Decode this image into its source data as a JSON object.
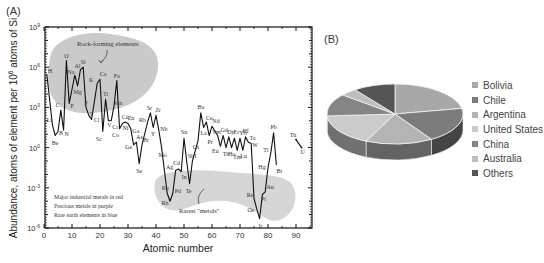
{
  "chart_data": [
    {
      "panel": "(A)",
      "type": "line",
      "title": "",
      "xlabel": "Atomic number",
      "ylabel": "Abundance, atoms of element per 10^6 atoms of Si",
      "xlim": [
        0,
        95
      ],
      "ylim_log10": [
        -6,
        9
      ],
      "xticks": [
        0,
        10,
        20,
        30,
        40,
        50,
        60,
        70,
        80,
        90
      ],
      "yticks": [
        "10^9",
        "10^6",
        "10^3",
        "10^0",
        "10^-3",
        "10^-6"
      ],
      "grid": false,
      "scale": "log",
      "points": [
        {
          "z": 1,
          "el": "H",
          "log": 5.5
        },
        {
          "z": 3,
          "el": "Li",
          "log": 1.7
        },
        {
          "z": 4,
          "el": "Be",
          "log": 0.9
        },
        {
          "z": 5,
          "el": "B",
          "log": 1.2
        },
        {
          "z": 6,
          "el": "C",
          "log": 2.8
        },
        {
          "z": 7,
          "el": "N",
          "log": 1.3
        },
        {
          "z": 8,
          "el": "O",
          "log": 6.5
        },
        {
          "z": 9,
          "el": "F",
          "log": 3.3
        },
        {
          "z": 11,
          "el": "Na",
          "log": 5.4
        },
        {
          "z": 12,
          "el": "Mg",
          "log": 4.6
        },
        {
          "z": 13,
          "el": "Al",
          "log": 5.8
        },
        {
          "z": 14,
          "el": "Si",
          "log": 6.0
        },
        {
          "z": 15,
          "el": "P",
          "log": 3.0
        },
        {
          "z": 16,
          "el": "S",
          "log": 2.4
        },
        {
          "z": 17,
          "el": "Cl",
          "log": 2.1
        },
        {
          "z": 19,
          "el": "K",
          "log": 4.8
        },
        {
          "z": 20,
          "el": "Ca",
          "log": 5.1
        },
        {
          "z": 21,
          "el": "Sc",
          "log": 1.2
        },
        {
          "z": 22,
          "el": "Ti",
          "log": 3.6
        },
        {
          "z": 23,
          "el": "V",
          "log": 2.0
        },
        {
          "z": 24,
          "el": "Cr",
          "log": 2.0
        },
        {
          "z": 25,
          "el": "Mn",
          "log": 3.1
        },
        {
          "z": 26,
          "el": "Fe",
          "log": 5.0
        },
        {
          "z": 27,
          "el": "Co",
          "log": 1.4
        },
        {
          "z": 28,
          "el": "Ni",
          "log": 1.8
        },
        {
          "z": 29,
          "el": "Cu",
          "log": 1.9
        },
        {
          "z": 30,
          "el": "Zn",
          "log": 1.8
        },
        {
          "z": 31,
          "el": "Ga",
          "log": 1.4
        },
        {
          "z": 32,
          "el": "Ge",
          "log": 0.2
        },
        {
          "z": 33,
          "el": "As",
          "log": 0.4
        },
        {
          "z": 34,
          "el": "Se",
          "log": -1.2
        },
        {
          "z": 35,
          "el": "Br",
          "log": 0.2
        },
        {
          "z": 37,
          "el": "Rb",
          "log": 1.9
        },
        {
          "z": 38,
          "el": "Sr",
          "log": 2.6
        },
        {
          "z": 39,
          "el": "Y",
          "log": 1.5
        },
        {
          "z": 40,
          "el": "Zr",
          "log": 2.4
        },
        {
          "z": 41,
          "el": "Nb",
          "log": 1.3
        },
        {
          "z": 42,
          "el": "Mo",
          "log": 0.0
        },
        {
          "z": 44,
          "el": "Ru",
          "log": -3.4
        },
        {
          "z": 45,
          "el": "Rh",
          "log": -4.0
        },
        {
          "z": 46,
          "el": "Pd",
          "log": -3.4
        },
        {
          "z": 47,
          "el": "Ag",
          "log": -1.7
        },
        {
          "z": 48,
          "el": "Cd",
          "log": -1.6
        },
        {
          "z": 49,
          "el": "In",
          "log": -1.8
        },
        {
          "z": 50,
          "el": "Sn",
          "log": 0.7
        },
        {
          "z": 51,
          "el": "Sb",
          "log": -1.1
        },
        {
          "z": 52,
          "el": "Te",
          "log": -2.7
        },
        {
          "z": 53,
          "el": "I",
          "log": -1.0
        },
        {
          "z": 55,
          "el": "Cs",
          "log": 0.5
        },
        {
          "z": 56,
          "el": "Ba",
          "log": 2.6
        },
        {
          "z": 57,
          "el": "La",
          "log": 1.5
        },
        {
          "z": 58,
          "el": "Ce",
          "log": 1.9
        },
        {
          "z": 59,
          "el": "Pr",
          "log": 0.9
        },
        {
          "z": 60,
          "el": "Nd",
          "log": 1.6
        },
        {
          "z": 62,
          "el": "Sm",
          "log": 0.9
        },
        {
          "z": 63,
          "el": "Eu",
          "log": 0.1
        },
        {
          "z": 64,
          "el": "Gd",
          "log": 0.9
        },
        {
          "z": 65,
          "el": "Tb",
          "log": 0.0
        },
        {
          "z": 66,
          "el": "Dy",
          "log": 0.8
        },
        {
          "z": 67,
          "el": "Ho",
          "log": 0.0
        },
        {
          "z": 68,
          "el": "Er",
          "log": 0.7
        },
        {
          "z": 69,
          "el": "Tm",
          "log": -0.2
        },
        {
          "z": 70,
          "el": "Yb",
          "log": 0.7
        },
        {
          "z": 71,
          "el": "Lu",
          "log": -0.2
        },
        {
          "z": 72,
          "el": "Hf",
          "log": 0.8
        },
        {
          "z": 73,
          "el": "Ta",
          "log": 0.4
        },
        {
          "z": 74,
          "el": "W",
          "log": 0.3
        },
        {
          "z": 75,
          "el": "Re",
          "log": -3.8
        },
        {
          "z": 76,
          "el": "Os",
          "log": -4.6
        },
        {
          "z": 77,
          "el": "Ir",
          "log": -5.3
        },
        {
          "z": 78,
          "el": "Pt",
          "log": -3.5
        },
        {
          "z": 79,
          "el": "Au",
          "log": -3.3
        },
        {
          "z": 80,
          "el": "Hg",
          "log": -1.5
        },
        {
          "z": 81,
          "el": "Tl",
          "log": -0.4
        },
        {
          "z": 82,
          "el": "Pb",
          "log": 1.1
        },
        {
          "z": 83,
          "el": "Bi",
          "log": -1.3
        },
        {
          "z": 90,
          "el": "Th",
          "log": 0.6
        },
        {
          "z": 92,
          "el": "U",
          "log": 0.0
        }
      ],
      "annotations": [
        {
          "text": "Rock-forming elements",
          "region": "upper-left shaded blob"
        },
        {
          "text": "Rarest \"metals\"",
          "region": "lower shaded band"
        },
        {
          "text": "Major industrial metals in red"
        },
        {
          "text": "Precious metals in purple"
        },
        {
          "text": "Rare earth elements in blue"
        }
      ]
    },
    {
      "panel": "(B)",
      "type": "pie",
      "title": "",
      "categories": [
        "Bolivia",
        "Chile",
        "Argentina",
        "United States",
        "China",
        "Australia",
        "Others"
      ],
      "values": [
        22,
        19,
        16,
        17,
        12,
        4,
        10
      ],
      "legend_position": "right",
      "style": "3d"
    }
  ],
  "panels": {
    "a_label": "(A)",
    "b_label": "(B)"
  },
  "chartA": {
    "xlabel": "Atomic number",
    "ylabel": "Abundance, atoms of element per 10",
    "ylabel_sup": "6",
    "ylabel_tail": " atoms of Si",
    "xticks": [
      "0",
      "10",
      "20",
      "30",
      "40",
      "50",
      "60",
      "70",
      "80",
      "90"
    ],
    "yticks": [
      {
        "base": "10",
        "exp": "9"
      },
      {
        "base": "10",
        "exp": "6"
      },
      {
        "base": "10",
        "exp": "3"
      },
      {
        "base": "10",
        "exp": "0"
      },
      {
        "base": "10",
        "exp": "-3"
      },
      {
        "base": "10",
        "exp": "-6"
      }
    ],
    "rock_label": "Rock-forming elements",
    "rare_label": "Rarest \"metals\"",
    "notes": [
      "Major industrial metals in red",
      "Precious metals in purple",
      "Rare earth elements in blue"
    ]
  },
  "legend": {
    "items": [
      {
        "label": "Bolivia",
        "color": "#a8a8a8"
      },
      {
        "label": "Chile",
        "color": "#7c7c7c"
      },
      {
        "label": "Argentina",
        "color": "#b4b4b4"
      },
      {
        "label": "United States",
        "color": "#cbcbcb"
      },
      {
        "label": "China",
        "color": "#858585"
      },
      {
        "label": "Australia",
        "color": "#bdbdbd"
      },
      {
        "label": "Others",
        "color": "#555555"
      }
    ]
  }
}
